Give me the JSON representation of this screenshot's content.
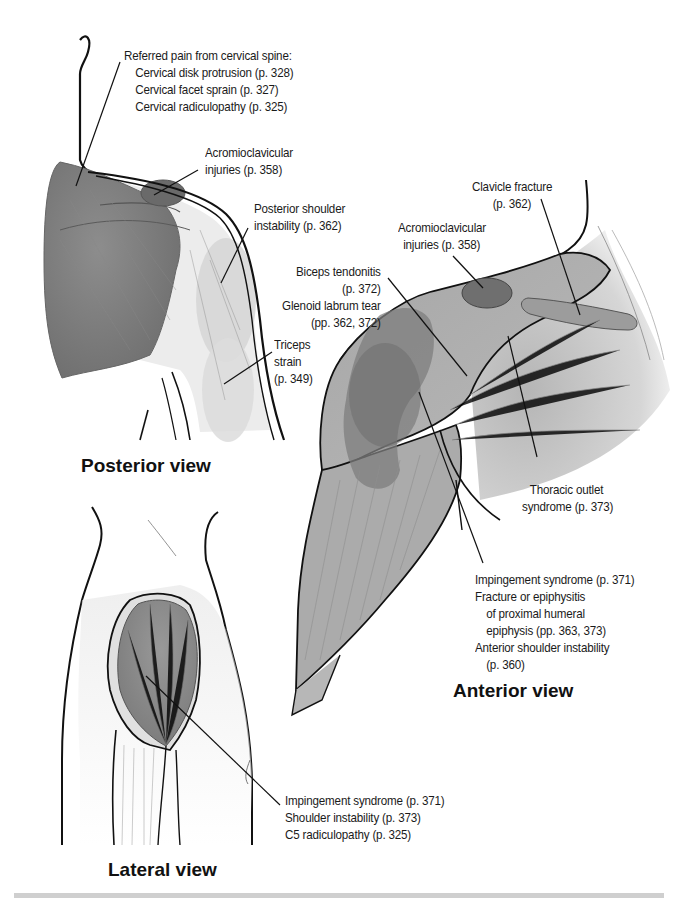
{
  "figure": {
    "colors": {
      "muscle_dark": "#7d7d7d",
      "muscle_mid": "#9a9a9a",
      "muscle_light": "#c9c9c9",
      "highlight_light": "#d8d8d8",
      "outline": "#111111",
      "rule": "#cfcfcf"
    },
    "posterior": {
      "title": "Posterior view",
      "labels": {
        "referred_pain": {
          "heading": "Referred pain from cervical spine:",
          "items": [
            "Cervical disk protrusion (p. 328)",
            "Cervical facet sprain (p. 327)",
            "Cervical radiculopathy (p. 325)"
          ]
        },
        "acromioclavicular": [
          "Acromioclavicular",
          "injuries (p. 358)"
        ],
        "posterior_instability": [
          "Posterior shoulder",
          "instability (p. 362)"
        ],
        "triceps": [
          "Triceps",
          "strain",
          "(p. 349)"
        ]
      }
    },
    "anterior": {
      "title": "Anterior view",
      "labels": {
        "clavicle": [
          "Clavicle fracture",
          "(p. 362)"
        ],
        "acromioclavicular": [
          "Acromioclavicular",
          "injuries (p. 358)"
        ],
        "biceps_glenoid": [
          "Biceps tendonitis",
          "(p. 372)",
          "Glenoid labrum tear",
          "(pp. 362, 372)"
        ],
        "thoracic_outlet": [
          "Thoracic outlet",
          "syndrome (p. 373)"
        ],
        "impingement_group": {
          "items": [
            "Impingement syndrome (p. 371)",
            "Fracture or epiphysitis",
            "of proximal humeral",
            "epiphysis (pp. 363, 373)",
            "Anterior shoulder instability",
            "(p. 360)"
          ]
        }
      }
    },
    "lateral": {
      "title": "Lateral view",
      "labels": {
        "deltoid_group": [
          "Impingement syndrome (p. 371)",
          "Shoulder instability (p. 373)",
          "C5 radiculopathy (p. 325)"
        ]
      }
    }
  }
}
